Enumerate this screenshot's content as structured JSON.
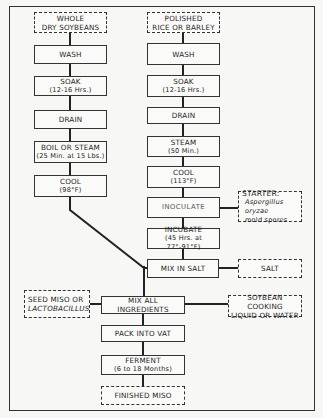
{
  "diagram": {
    "type": "flowchart",
    "soybean_column": {
      "start": {
        "line1": "WHOLE",
        "line2": "DRY SOYBEANS"
      },
      "steps": [
        {
          "label": "WASH"
        },
        {
          "label": "SOAK",
          "detail": "(12-16 Hrs.)"
        },
        {
          "label": "DRAIN"
        },
        {
          "label": "BOIL OR STEAM",
          "detail": "(25 Min. at 15 Lbs.)"
        },
        {
          "label": "COOL",
          "detail": "(98°F)"
        }
      ]
    },
    "grain_column": {
      "start": {
        "line1": "POLISHED",
        "line2": "RICE OR BARLEY"
      },
      "steps": [
        {
          "label": "WASH"
        },
        {
          "label": "SOAK",
          "detail": "(12-16 Hrs.)"
        },
        {
          "label": "DRAIN"
        },
        {
          "label": "STEAM",
          "detail": "(50 Min.)"
        },
        {
          "label": "COOL",
          "detail": "(113°F)"
        },
        {
          "label": "INOCULATE"
        },
        {
          "label": "INCUBATE",
          "detail": "(45 Hrs. at 77°-91°F)"
        },
        {
          "label": "MIX IN SALT"
        }
      ]
    },
    "inputs": {
      "starter": {
        "title": "STARTER:",
        "line1": "Aspergillus oryzae",
        "line2": "mold spores"
      },
      "salt": {
        "label": "SALT"
      },
      "seed": {
        "line1": "SEED MISO OR",
        "line2": "LACTOBACILLUS"
      },
      "liquid": {
        "line1": "SOYBEAN COOKING",
        "line2": "LIQUID OR WATER"
      }
    },
    "final_steps": [
      {
        "label": "MIX ALL INGREDIENTS"
      },
      {
        "label": "PACK INTO VAT"
      },
      {
        "label": "FERMENT",
        "detail": "(6 to 18 Months)"
      }
    ],
    "end": {
      "label": "FINISHED MISO"
    }
  }
}
